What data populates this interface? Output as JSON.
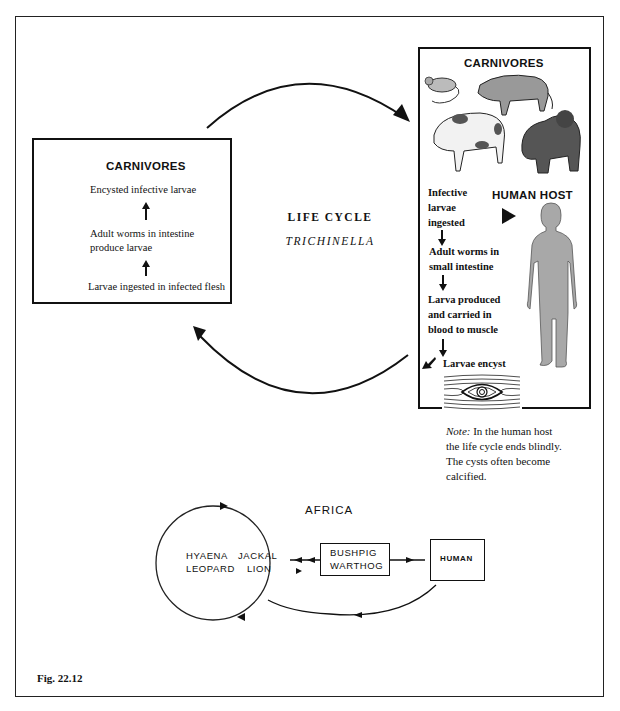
{
  "figure": {
    "caption": "Fig. 22.12",
    "center_title": {
      "line1": "LIFE CYCLE",
      "line2": "TRICHINELLA"
    }
  },
  "left_box": {
    "title": "CARNIVORES",
    "steps": [
      "Encysted infective larvae",
      "Adult worms in intestine",
      "produce larvae",
      "Larvae ingested in infected flesh"
    ]
  },
  "right_box": {
    "title": "CARNIVORES",
    "animals": [
      "rat-icon",
      "boar-icon",
      "pig-icon",
      "bear-icon"
    ],
    "human_host_label": "HUMAN HOST",
    "steps": [
      [
        "Infective",
        "larvae",
        "ingested"
      ],
      [
        "Adult worms in",
        "small intestine"
      ],
      [
        "Larva produced",
        "and carried in",
        "blood to muscle"
      ],
      [
        "Larvae encyst"
      ]
    ]
  },
  "note": {
    "label": "Note:",
    "line1": " In the human host",
    "line2": "the life cycle ends blindly.",
    "line3": "The cysts often become",
    "line4": "calcified."
  },
  "africa": {
    "title": "AFRICA",
    "circle_animals": {
      "row1_left": "HYAENA",
      "row1_right": "JACKAL",
      "row2_left": "LEOPARD",
      "row2_right": "LION"
    },
    "bushpig_box": {
      "line1": "BUSHPIG",
      "line2": "WARTHOG"
    },
    "human_box": "HUMAN"
  }
}
